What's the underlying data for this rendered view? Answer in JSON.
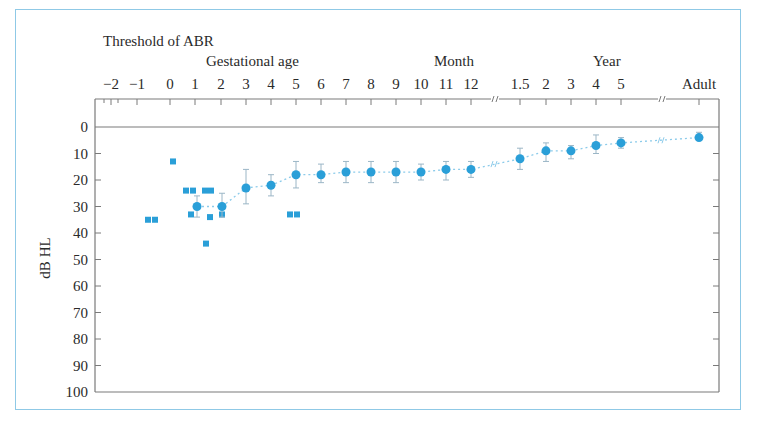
{
  "chart_data": {
    "type": "scatter",
    "title": "Threshold of ABR",
    "xlabel_groups": [
      "Gestational age",
      "Month",
      "Year"
    ],
    "ylabel": "dB HL",
    "ylim": [
      0,
      100
    ],
    "y_inverted": true,
    "y_ticks": [
      0,
      10,
      20,
      30,
      40,
      50,
      60,
      70,
      80,
      90,
      100
    ],
    "x_tick_labels": [
      "−2",
      "−1",
      "0",
      "1",
      "2",
      "3",
      "4",
      "5",
      "6",
      "7",
      "8",
      "9",
      "10",
      "11",
      "12",
      "1.5",
      "2",
      "3",
      "4",
      "5",
      "Adult"
    ],
    "x_axis_breaks": [
      "between 12 months and 1.5 years",
      "between 5 years and Adult"
    ],
    "grid": false,
    "series": [
      {
        "name": "Individual thresholds (squares)",
        "marker": "square",
        "color": "#2a9fd8",
        "points": [
          {
            "x": "-1.5",
            "y": 35
          },
          {
            "x": "-1.2",
            "y": 35
          },
          {
            "x": "0.1",
            "y": 13
          },
          {
            "x": "0.7",
            "y": 24
          },
          {
            "x": "0.9",
            "y": 24
          },
          {
            "x": "1.3",
            "y": 24
          },
          {
            "x": "1.6",
            "y": 24
          },
          {
            "x": "0.8",
            "y": 33
          },
          {
            "x": "1.5",
            "y": 34
          },
          {
            "x": "1.4",
            "y": 44
          },
          {
            "x": "2",
            "y": 33
          },
          {
            "x": "4.8",
            "y": 33
          },
          {
            "x": "5.1",
            "y": 33
          }
        ]
      },
      {
        "name": "Mean threshold ± SD (circles)",
        "marker": "circle",
        "color": "#2a9fd8",
        "line": "dotted",
        "points": [
          {
            "x": "GA 1",
            "y": 30,
            "err": [
              26,
              34
            ]
          },
          {
            "x": "GA 2",
            "y": 30,
            "err": [
              25,
              34
            ]
          },
          {
            "x": "Month 3",
            "y": 23,
            "err": [
              16,
              29
            ]
          },
          {
            "x": "Month 4",
            "y": 22,
            "err": [
              18,
              26
            ]
          },
          {
            "x": "Month 5",
            "y": 18,
            "err": [
              13,
              23
            ]
          },
          {
            "x": "Month 6",
            "y": 18,
            "err": [
              14,
              21
            ]
          },
          {
            "x": "Month 7",
            "y": 17,
            "err": [
              13,
              21
            ]
          },
          {
            "x": "Month 8",
            "y": 17,
            "err": [
              13,
              21
            ]
          },
          {
            "x": "Month 9",
            "y": 17,
            "err": [
              13,
              21
            ]
          },
          {
            "x": "Month 10",
            "y": 17,
            "err": [
              14,
              20
            ]
          },
          {
            "x": "Month 11",
            "y": 16,
            "err": [
              13,
              20
            ]
          },
          {
            "x": "Month 12",
            "y": 16,
            "err": [
              13,
              19
            ]
          },
          {
            "x": "Year 1.5",
            "y": 12,
            "err": [
              8,
              16
            ]
          },
          {
            "x": "Year 2",
            "y": 9,
            "err": [
              6,
              13
            ]
          },
          {
            "x": "Year 3",
            "y": 9,
            "err": [
              7,
              12
            ]
          },
          {
            "x": "Year 4",
            "y": 7,
            "err": [
              3,
              10
            ]
          },
          {
            "x": "Year 5",
            "y": 6,
            "err": [
              4,
              8
            ]
          },
          {
            "x": "Adult",
            "y": 4,
            "err": [
              2,
              5
            ]
          }
        ]
      }
    ]
  },
  "text": {
    "title": "Threshold of ABR",
    "group_gestational": "Gestational age",
    "group_month": "Month",
    "group_year": "Year",
    "ylabel": "dB HL"
  }
}
